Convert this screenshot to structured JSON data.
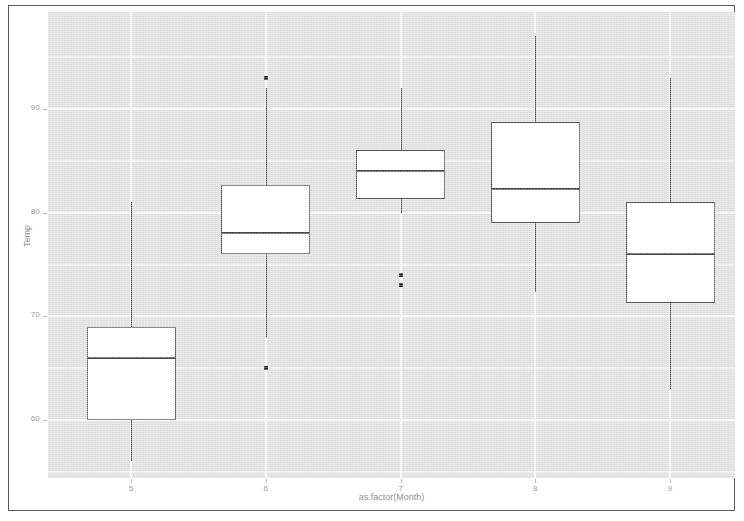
{
  "chart_data": {
    "type": "box",
    "title": "",
    "subtitle": "",
    "xlabel": "as.factor(Month)",
    "ylabel": "Temp",
    "categories": [
      "5",
      "6",
      "7",
      "8",
      "9"
    ],
    "xtick_labels": [
      "5",
      "6",
      "7",
      "8",
      "9"
    ],
    "ytick_labels": [
      "60",
      "70",
      "80",
      "90"
    ],
    "yticks": [
      60,
      70,
      80,
      90
    ],
    "ylim": [
      54.5,
      99.5
    ],
    "grid": true,
    "legend": "none",
    "boxes": [
      {
        "category": "5",
        "whisker_low": 56,
        "q1": 60,
        "median": 66,
        "q3": 69,
        "whisker_high": 81,
        "outliers": []
      },
      {
        "category": "6",
        "whisker_low": 68,
        "q1": 76,
        "median": 78,
        "q3": 82.7,
        "whisker_high": 92,
        "outliers": [
          65,
          93
        ]
      },
      {
        "category": "7",
        "whisker_low": 80,
        "q1": 81.3,
        "median": 84,
        "q3": 86,
        "whisker_high": 92,
        "outliers": [
          73,
          74
        ]
      },
      {
        "category": "8",
        "whisker_low": 72.3,
        "q1": 79,
        "median": 82.3,
        "q3": 88.7,
        "whisker_high": 97,
        "outliers": []
      },
      {
        "category": "9",
        "whisker_low": 63,
        "q1": 71.3,
        "median": 76,
        "q3": 81,
        "whisker_high": 93,
        "outliers": []
      }
    ]
  },
  "style": {
    "panel_fill": "#dedede",
    "grid_major_color": "#f7f7f7",
    "grid_minor_color": "#ebebeb",
    "box_fill": "#ffffff",
    "box_stroke": "#4d4d4d",
    "axis_text_color": "#9a9a9a",
    "frame_color": "#5a5a5a"
  }
}
